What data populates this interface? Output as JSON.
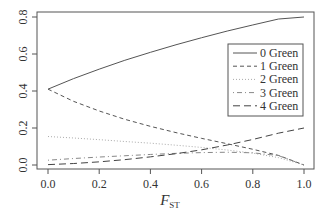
{
  "chart_data": {
    "type": "line",
    "title": "",
    "xlabel": "F",
    "xlabel_sub": "ST",
    "ylabel": "",
    "xlim": [
      0,
      1
    ],
    "ylim": [
      0,
      0.8
    ],
    "xticks": [
      "0.0",
      "0.2",
      "0.4",
      "0.6",
      "0.8",
      "1.0"
    ],
    "yticks": [
      "0.0",
      "0.2",
      "0.4",
      "0.6",
      "0.8"
    ],
    "grid": false,
    "legend_position": "top-right",
    "x": [
      0,
      0.1,
      0.2,
      0.3,
      0.4,
      0.5,
      0.6,
      0.7,
      0.8,
      0.9,
      1.0
    ],
    "series": [
      {
        "name": "0 Green",
        "style": "solid",
        "values": [
          0.41,
          0.467,
          0.518,
          0.566,
          0.609,
          0.65,
          0.688,
          0.724,
          0.757,
          0.789,
          0.8
        ]
      },
      {
        "name": "1 Green",
        "style": "dashed",
        "values": [
          0.41,
          0.344,
          0.292,
          0.247,
          0.209,
          0.175,
          0.144,
          0.115,
          0.085,
          0.052,
          0.0
        ]
      },
      {
        "name": "2 Green",
        "style": "dotted",
        "values": [
          0.154,
          0.146,
          0.137,
          0.127,
          0.118,
          0.107,
          0.095,
          0.081,
          0.064,
          0.04,
          0.0
        ]
      },
      {
        "name": "3 Green",
        "style": "dotdash",
        "values": [
          0.026,
          0.035,
          0.043,
          0.05,
          0.057,
          0.063,
          0.067,
          0.069,
          0.066,
          0.051,
          0.0
        ]
      },
      {
        "name": "4 Green",
        "style": "longdash",
        "values": [
          0.002,
          0.008,
          0.017,
          0.029,
          0.044,
          0.061,
          0.082,
          0.108,
          0.138,
          0.172,
          0.2
        ]
      }
    ]
  }
}
